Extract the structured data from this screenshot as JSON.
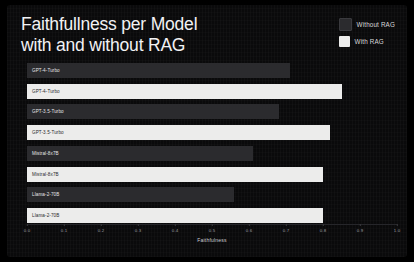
{
  "slide": {
    "background_color": "#0b0b0c",
    "title": "Faithfullness per Model\nwith and without RAG"
  },
  "legend": {
    "position": "top-right",
    "entries": [
      {
        "label": "Without RAG",
        "color": "#2b2b2e"
      },
      {
        "label": "With RAG",
        "color": "#ececeb"
      }
    ]
  },
  "axis": {
    "xlabel": "Faithfulness",
    "ticks": [
      "0.0",
      "0.1",
      "0.2",
      "0.3",
      "0.4",
      "0.5",
      "0.6",
      "0.7",
      "0.8",
      "0.9",
      "1.0"
    ]
  },
  "chart_data": {
    "type": "bar",
    "orientation": "horizontal",
    "title": "Faithfullness per Model with and without RAG",
    "xlabel": "Faithfulness",
    "ylabel": "",
    "xlim": [
      0.0,
      1.0
    ],
    "grid": false,
    "legend_position": "top-right",
    "categories": [
      "GPT-4-Turbo",
      "GPT-3.5-Turbo",
      "Mistral-8x7B",
      "Llama-2-70B"
    ],
    "series": [
      {
        "name": "Without RAG",
        "color": "#2b2b2e",
        "values": [
          0.71,
          0.68,
          0.61,
          0.56
        ]
      },
      {
        "name": "With RAG",
        "color": "#ececeb",
        "values": [
          0.85,
          0.82,
          0.8,
          0.8
        ]
      }
    ],
    "bar_labels": [
      {
        "text": "GPT-4-Turbo",
        "series": "Without RAG"
      },
      {
        "text": "GPT-4-Turbo",
        "series": "With RAG"
      },
      {
        "text": "GPT-3.5-Turbo",
        "series": "Without RAG"
      },
      {
        "text": "GPT-3.5-Turbo",
        "series": "With RAG"
      },
      {
        "text": "Mistral-8x7B",
        "series": "Without RAG"
      },
      {
        "text": "Mistral-8x7B",
        "series": "With RAG"
      },
      {
        "text": "Llama-2-70B",
        "series": "Without RAG"
      },
      {
        "text": "Llama-2-70B",
        "series": "With RAG"
      }
    ]
  }
}
